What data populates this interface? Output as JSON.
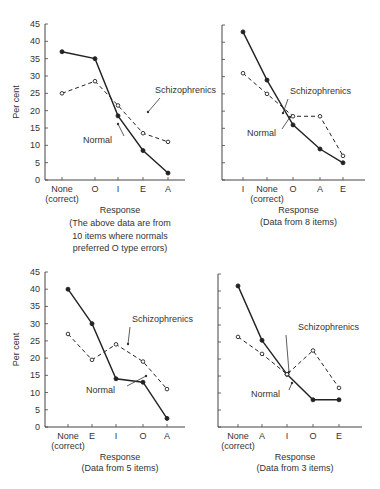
{
  "chart_data": [
    {
      "type": "line",
      "panel": "top-left",
      "categories": [
        "None (correct)",
        "O",
        "I",
        "E",
        "A"
      ],
      "series": [
        {
          "name": "Normal",
          "style": "solid, filled markers",
          "values": [
            37,
            35,
            18.5,
            8.5,
            2
          ]
        },
        {
          "name": "Schizophrenics",
          "style": "dashed, open markers",
          "values": [
            25,
            28.5,
            21.5,
            13.5,
            11
          ]
        }
      ],
      "xlabel": "Response",
      "caption": "(The above data are from 10 items where normals preferred O type errors)",
      "ylabel": "Per cent",
      "ylim": [
        0,
        45
      ],
      "yticks": [
        0,
        5,
        10,
        15,
        20,
        25,
        30,
        35,
        40,
        45
      ],
      "annotations": [
        "Schizophrenics",
        "Normal"
      ]
    },
    {
      "type": "line",
      "panel": "top-right",
      "categories": [
        "I",
        "None (correct)",
        "O",
        "A",
        "E"
      ],
      "series": [
        {
          "name": "Normal",
          "style": "solid, filled markers",
          "values": [
            43,
            29,
            16,
            9,
            5
          ]
        },
        {
          "name": "Schizophrenics",
          "style": "dashed, open markers",
          "values": [
            31,
            25,
            18.5,
            18.5,
            7
          ]
        }
      ],
      "xlabel": "Response",
      "caption": "(Data from 8 items)",
      "ylim": [
        0,
        45
      ],
      "annotations": [
        "Schizophrenics",
        "Normal"
      ]
    },
    {
      "type": "line",
      "panel": "bottom-left",
      "categories": [
        "None (correct)",
        "E",
        "I",
        "O",
        "A"
      ],
      "series": [
        {
          "name": "Normal",
          "style": "solid, filled markers",
          "values": [
            40,
            30,
            14,
            13,
            2.5
          ]
        },
        {
          "name": "Schizophrenics",
          "style": "dashed, open markers",
          "values": [
            27,
            19.5,
            24,
            19,
            11
          ]
        }
      ],
      "xlabel": "Response",
      "caption": "(Data from 5 items)",
      "ylabel": "Per cent",
      "ylim": [
        0,
        45
      ],
      "yticks": [
        0,
        5,
        10,
        15,
        20,
        25,
        30,
        35,
        40,
        45
      ],
      "annotations": [
        "Schizophrenics",
        "Normal"
      ]
    },
    {
      "type": "line",
      "panel": "bottom-right",
      "categories": [
        "None (correct)",
        "A",
        "I",
        "O",
        "E"
      ],
      "series": [
        {
          "name": "Normal",
          "style": "solid, filled markers",
          "values": [
            41.5,
            25.5,
            15.5,
            8,
            8
          ]
        },
        {
          "name": "Schizophrenics",
          "style": "dashed, open markers",
          "values": [
            26.5,
            21.5,
            15.5,
            22.5,
            11.5
          ]
        }
      ],
      "xlabel": "Response",
      "caption": "(Data from 3 items)",
      "ylim": [
        0,
        45
      ],
      "annotations": [
        "Schizophrenics",
        "Normal"
      ]
    }
  ],
  "labels": {
    "ylabel": "Per cent",
    "xlabel": "Response",
    "schiz": "Schizophrenics",
    "normal": "Normal",
    "none": "None",
    "correct": "(correct)",
    "yticks": [
      "0",
      "5",
      "10",
      "15",
      "20",
      "25",
      "30",
      "35",
      "40",
      "45"
    ],
    "tl_cats": [
      "",
      "O",
      "I",
      "E",
      "A"
    ],
    "tr_cats": [
      "I",
      "",
      "O",
      "A",
      "E"
    ],
    "bl_cats": [
      "",
      "E",
      "I",
      "O",
      "A"
    ],
    "br_cats": [
      "",
      "A",
      "I",
      "O",
      "E"
    ],
    "tl_caption": [
      "(The above data are from",
      "10 items where normals",
      "preferred O type errors)"
    ],
    "tr_caption": "(Data from 8 items)",
    "bl_caption": "(Data from 5 items)",
    "br_caption": "(Data from 3 items)"
  }
}
